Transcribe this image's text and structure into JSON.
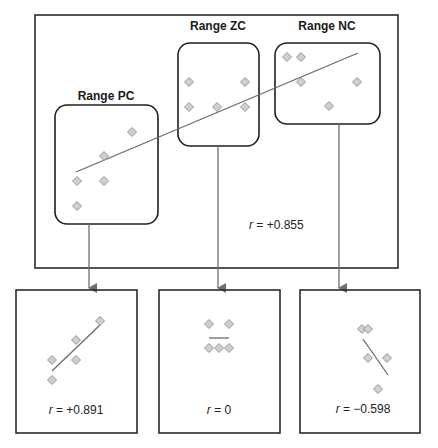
{
  "diagram": {
    "main_panel": {
      "r_label_var": "r",
      "r_label_value": " = +0.855",
      "ranges": [
        {
          "label": "Range PC",
          "points": [
            [
              77,
              181
            ],
            [
              77,
              206
            ],
            [
              104,
              181
            ],
            [
              104,
              156
            ],
            [
              132,
              132
            ]
          ]
        },
        {
          "label": "Range ZC",
          "points": [
            [
              189,
              82
            ],
            [
              189,
              107
            ],
            [
              217,
              107
            ],
            [
              245,
              82
            ],
            [
              245,
              107
            ]
          ]
        },
        {
          "label": "Range NC",
          "points": [
            [
              287,
              57
            ],
            [
              301,
              57
            ],
            [
              301,
              82
            ],
            [
              357,
              82
            ],
            [
              329,
              106
            ]
          ]
        }
      ]
    },
    "sub_panels": [
      {
        "name": "PC",
        "r_label_var": "r",
        "r_label_value": " = +0.891",
        "points": [
          [
            52,
            380
          ],
          [
            52,
            360
          ],
          [
            76,
            360
          ],
          [
            76,
            340
          ],
          [
            100,
            321
          ]
        ]
      },
      {
        "name": "ZC",
        "r_label_var": "r",
        "r_label_value": " = 0",
        "points": [
          [
            209,
            324
          ],
          [
            229,
            324
          ],
          [
            209,
            348
          ],
          [
            219,
            348
          ],
          [
            229,
            348
          ]
        ]
      },
      {
        "name": "NC",
        "r_label_var": "r",
        "r_label_value": " = −0.598",
        "points": [
          [
            362,
            329
          ],
          [
            368,
            329
          ],
          [
            368,
            358
          ],
          [
            387,
            358
          ],
          [
            378,
            389
          ]
        ]
      }
    ]
  },
  "chart_data": {
    "type": "scatter",
    "title": "",
    "overall": {
      "r": 0.855,
      "regression": "positive"
    },
    "ranges": [
      {
        "name": "Range PC",
        "r": 0.891,
        "correlation": "positive",
        "n": 5
      },
      {
        "name": "Range ZC",
        "r": 0,
        "correlation": "zero",
        "n": 5
      },
      {
        "name": "Range NC",
        "r": -0.598,
        "correlation": "negative",
        "n": 5
      }
    ]
  }
}
